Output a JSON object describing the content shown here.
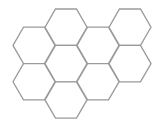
{
  "diagram": {
    "type": "hexagonal-grid",
    "orientation": "flat-top",
    "cell_count": 9,
    "stroke_color": "#9a9a9a",
    "fill_color": "#ffffff",
    "columns": [
      {
        "column": 0,
        "rows": [
          1,
          3
        ]
      },
      {
        "column": 1,
        "rows": [
          0,
          2,
          4
        ]
      },
      {
        "column": 2,
        "rows": [
          1,
          3
        ]
      },
      {
        "column": 3,
        "rows": [
          0,
          2
        ]
      }
    ]
  }
}
